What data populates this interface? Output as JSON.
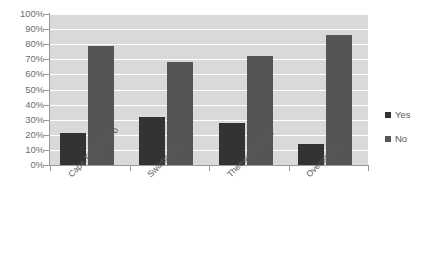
{
  "chart_data": {
    "type": "bar",
    "title": "",
    "subtitle": "",
    "xlabel": "",
    "ylabel": "",
    "categories": [
      "Cape Town Metro",
      "Swartland",
      "Theewaterskloof",
      "Overstrand"
    ],
    "series": [
      {
        "name": "Yes",
        "color": "#333333",
        "values": [
          21,
          32,
          28,
          14
        ]
      },
      {
        "name": "No",
        "color": "#555555",
        "values": [
          79,
          68,
          72,
          86
        ]
      }
    ],
    "ylim": [
      0,
      100
    ],
    "ytick_values": [
      0,
      10,
      20,
      30,
      40,
      50,
      60,
      70,
      80,
      90,
      100
    ],
    "ytick_labels": [
      "0%",
      "10%",
      "20%",
      "30%",
      "40%",
      "50%",
      "60%",
      "70%",
      "80%",
      "90%",
      "100%"
    ],
    "yaxis_unit": "%",
    "grid": true,
    "grid_axis": "y",
    "grid_color": "#ffffff",
    "plot_background": "#d9d9d9",
    "page_background": "#ffffff",
    "axis_color": "#9a9a9a",
    "tick_label_color": "#6e6e6e",
    "category_label_rotation": -45,
    "legend_position": "right",
    "legend_entries": [
      "Yes",
      "No"
    ]
  }
}
